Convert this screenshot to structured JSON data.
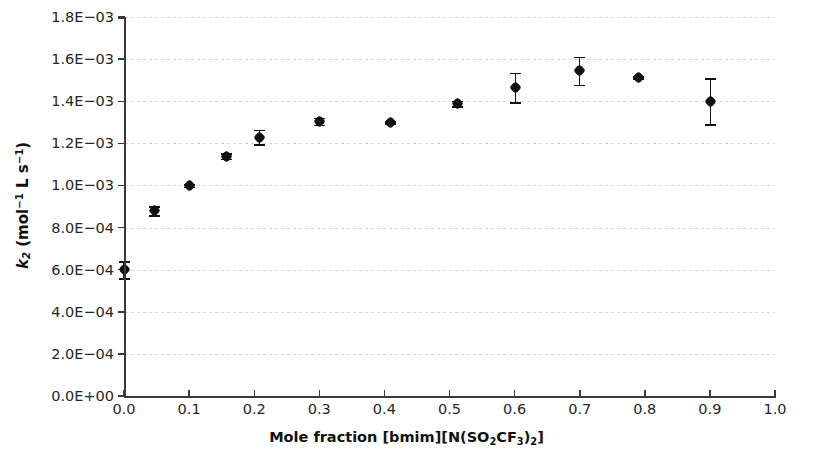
{
  "chart_data": {
    "type": "scatter",
    "title": "",
    "xlabel": "Mole fraction [bmim][N(SO2CF3)2]",
    "ylabel": "k2 (mol-1 L s-1)",
    "xlim": [
      0.0,
      1.0
    ],
    "ylim": [
      0.0,
      0.0018
    ],
    "grid": true,
    "legend": "none",
    "errorbars": true,
    "xticks": [
      "0.0",
      "0.1",
      "0.2",
      "0.3",
      "0.4",
      "0.5",
      "0.6",
      "0.7",
      "0.8",
      "0.9",
      "1.0"
    ],
    "xtick_values": [
      0.0,
      0.1,
      0.2,
      0.3,
      0.4,
      0.5,
      0.6,
      0.7,
      0.8,
      0.9,
      1.0
    ],
    "yticks": [
      "0.0E+00",
      "2.0E−04",
      "4.0E−04",
      "6.0E−04",
      "8.0E−04",
      "1.0E−03",
      "1.2E−03",
      "1.4E−03",
      "1.6E−03",
      "1.8E−03"
    ],
    "ytick_values": [
      0.0,
      0.0002,
      0.0004,
      0.0006,
      0.0008,
      0.001,
      0.0012,
      0.0014,
      0.0016,
      0.0018
    ],
    "series": [
      {
        "name": "k2 vs mole fraction",
        "marker": "diamond",
        "color": "#111111",
        "x": [
          0.0,
          0.047,
          0.101,
          0.158,
          0.208,
          0.3,
          0.41,
          0.512,
          0.601,
          0.7,
          0.791,
          0.901
        ],
        "y": [
          0.0006,
          0.00088,
          0.001,
          0.00114,
          0.00123,
          0.001305,
          0.0013,
          0.00139,
          0.001465,
          0.001545,
          0.001515,
          0.0014
        ],
        "yerr": [
          4e-05,
          2.2e-05,
          6e-06,
          1.4e-05,
          3.5e-05,
          1.6e-05,
          5e-06,
          1.3e-05,
          7e-05,
          6.6e-05,
          5e-06,
          0.00011
        ]
      }
    ]
  },
  "axes": {
    "y_title_main": "k",
    "y_title_sub": "2",
    "y_title_unit_pre": " (mol",
    "y_title_unit_sup1": "−1",
    "y_title_unit_mid": " L s",
    "y_title_unit_sup2": "−1",
    "y_title_unit_post": ")",
    "x_title_pre": "Mole fraction [bmim][N(SO",
    "x_title_sub1": "2",
    "x_title_mid": "CF",
    "x_title_sub2": "3",
    "x_title_mid2": ")",
    "x_title_sub3": "2",
    "x_title_post": "]"
  }
}
